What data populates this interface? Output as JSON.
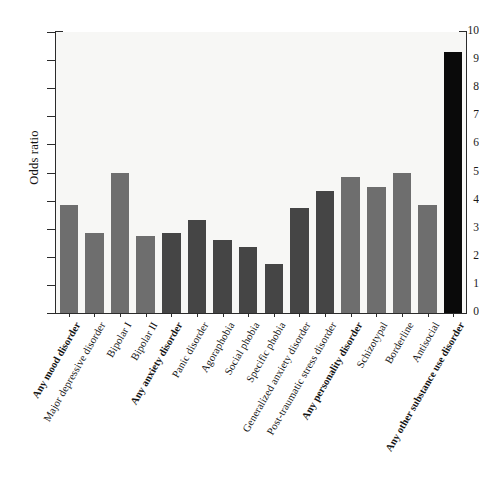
{
  "chart_data": {
    "type": "bar",
    "title": "",
    "xlabel": "",
    "ylabel": "Odds ratio",
    "ylim": [
      0,
      10
    ],
    "ytick_labels": [
      "0",
      "1",
      "2",
      "3",
      "4",
      "5",
      "6",
      "7",
      "8",
      "9",
      "10"
    ],
    "ytick_values": [
      0,
      1,
      2,
      3,
      4,
      5,
      6,
      7,
      8,
      9,
      10
    ],
    "grid": false,
    "legend": "none",
    "categories": [
      "Any mood disorder",
      "Major depressive disorder",
      "Bipolar I",
      "Bipolar II",
      "Any anxiety disorder",
      "Panic disorder",
      "Agoraphobia",
      "Social phobia",
      "Specific phobia",
      "Generalized anxiety disorder",
      "Post-traumatic stress disorder",
      "Any personality disorder",
      "Schizotypal",
      "Borderline",
      "Antisocial",
      "Any other substance use disorder"
    ],
    "values": [
      3.85,
      2.85,
      5.0,
      2.75,
      2.85,
      3.3,
      2.6,
      2.35,
      1.75,
      3.75,
      4.35,
      4.85,
      4.5,
      5.0,
      3.85,
      9.3
    ],
    "bar_colors": [
      "#6e6e6e",
      "#6e6e6e",
      "#6e6e6e",
      "#6e6e6e",
      "#454545",
      "#454545",
      "#454545",
      "#454545",
      "#454545",
      "#454545",
      "#454545",
      "#6e6e6e",
      "#6e6e6e",
      "#6e6e6e",
      "#6e6e6e",
      "#0a0a0a"
    ],
    "bold_labels": [
      true,
      false,
      false,
      false,
      true,
      false,
      false,
      false,
      false,
      false,
      false,
      true,
      false,
      false,
      false,
      true
    ],
    "plot_background": "#f7f7f5",
    "axis_color": "#2b2b2b"
  }
}
